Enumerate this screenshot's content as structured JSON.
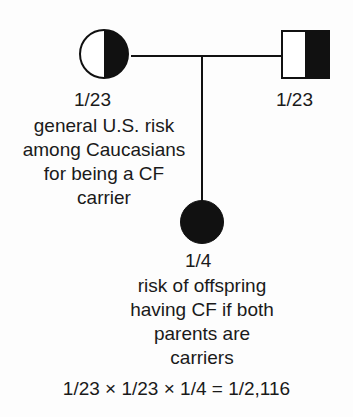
{
  "diagram": {
    "line_color": "#111111",
    "fill_color": "#111111",
    "background_color": "#fdfdfd"
  },
  "mother": {
    "symbol": "circle-half-filled",
    "sex": "female",
    "status": "carrier",
    "risk_label": "1/23",
    "caption_lines": [
      "general U.S. risk",
      "among Caucasians",
      "for being a CF",
      "carrier"
    ]
  },
  "father": {
    "symbol": "square-half-filled",
    "sex": "male",
    "status": "carrier",
    "risk_label": "1/23"
  },
  "offspring": {
    "symbol": "circle-filled",
    "sex": "female",
    "status": "affected",
    "risk_label": "1/4",
    "caption_lines": [
      "risk of offspring",
      "having CF if both",
      "parents are",
      "carriers"
    ]
  },
  "equation": {
    "text": "1/23 × 1/23 × 1/4 = 1/2,116"
  }
}
